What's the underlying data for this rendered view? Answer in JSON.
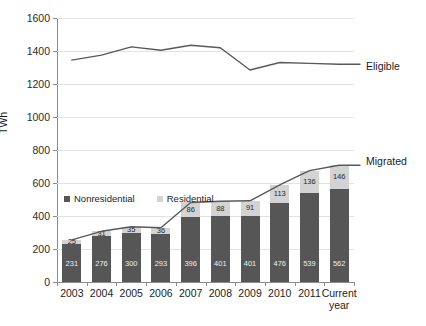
{
  "chart_data": {
    "type": "bar",
    "title": "",
    "subtitle": "",
    "xlabel": "",
    "ylabel": "TWh",
    "ylim": [
      0,
      1600
    ],
    "ytick_step": 200,
    "yticks": [
      0,
      200,
      400,
      600,
      800,
      1000,
      1200,
      1400,
      1600
    ],
    "grid": true,
    "legend_position": "inside-upper-left",
    "stacked": true,
    "categories": [
      "2003",
      "2004",
      "2005",
      "2006",
      "2007",
      "2008",
      "2009",
      "2010",
      "2011",
      "Current year"
    ],
    "category_lines": [
      [
        "2003"
      ],
      [
        "2004"
      ],
      [
        "2005"
      ],
      [
        "2006"
      ],
      [
        "2007"
      ],
      [
        "2008"
      ],
      [
        "2009"
      ],
      [
        "2010"
      ],
      [
        "2011"
      ],
      [
        "Current",
        "year"
      ]
    ],
    "series": [
      {
        "name": "Nonresidential",
        "kind": "bar-segment",
        "color": "#565656",
        "values": [
          231,
          276,
          300,
          293,
          396,
          401,
          401,
          476,
          539,
          562
        ]
      },
      {
        "name": "Residential",
        "kind": "bar-segment",
        "color": "#d3d3d3",
        "values": [
          25,
          31,
          35,
          36,
          86,
          88,
          91,
          113,
          136,
          146
        ]
      },
      {
        "name": "Eligible",
        "kind": "line",
        "color": "#595959",
        "values": [
          1345,
          1375,
          1425,
          1405,
          1435,
          1420,
          1285,
          1330,
          1325,
          1320
        ]
      },
      {
        "name": "Migrated",
        "kind": "line",
        "color": "#595959",
        "values": [
          256,
          307,
          335,
          329,
          482,
          489,
          492,
          589,
          675,
          708
        ]
      }
    ]
  },
  "legend": {
    "items": [
      {
        "label": "Nonresidential",
        "color": "#565656"
      },
      {
        "label": "Residential",
        "color": "#d3d3d3"
      }
    ]
  },
  "series_labels": {
    "eligible": "Eligible",
    "migrated": "Migrated"
  },
  "axes": {
    "y_title": "TWh"
  }
}
